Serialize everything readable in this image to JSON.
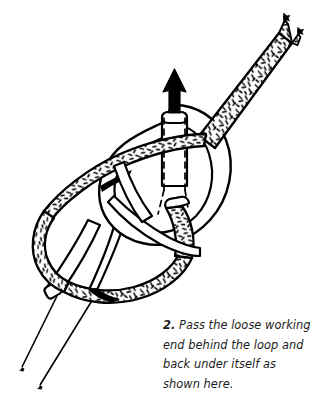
{
  "figure": {
    "background_color": "#ffffff",
    "ink_color": "#000000",
    "illustration_style": "black-and-white line art"
  },
  "caption": {
    "number": "2.",
    "text": "Pass the loose working end behind the loop and back under itself as shown here.",
    "lines": [
      "Pass the loose working",
      "end behind the loop and",
      "back under itself as",
      "shown here."
    ],
    "color": "#1c1c1c"
  },
  "diagram": {
    "elements": [
      {
        "name": "standing-part-rope",
        "style": "smooth white rope with black outline",
        "description": "Smooth rope forming the main loop and running down to the lower left"
      },
      {
        "name": "working-end-rope",
        "style": "textured speckled rope with black outline",
        "description": "Textured working end entering from upper right, wrapping around the loop and tucking back under itself"
      },
      {
        "name": "direction-arrow",
        "style": "solid black arrowhead pointing up",
        "description": "Indicates the pulling direction of the rope end emerging at the top of the knot"
      },
      {
        "name": "hidden-path-dashes",
        "style": "dashed black lines",
        "description": "Dashed outlines showing the rope path concealed behind overlapping strands"
      },
      {
        "name": "rope-tip-upper-right",
        "style": "tapered pointed rope tip",
        "description": "Two tapering tips of the textured rope at the upper right edge"
      },
      {
        "name": "rope-tip-lower-left",
        "style": "tapered pointed rope tip",
        "description": "Two tapering tips of the smooth rope at the lower left edge"
      },
      {
        "name": "cut-rope-end-left",
        "style": "blunt cut end",
        "description": "Blunt cut end of the smooth rope at the left of the knot"
      },
      {
        "name": "cut-rope-end-center",
        "style": "blunt cut end",
        "description": "Blunt cut end of the textured working rope in the center of the knot"
      }
    ]
  }
}
